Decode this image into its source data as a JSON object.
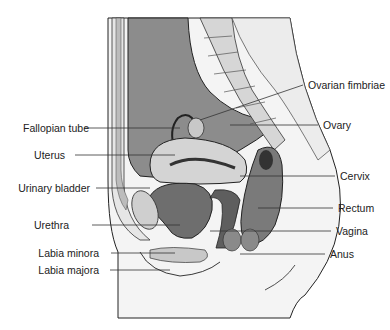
{
  "diagram": {
    "type": "anatomical-sagittal-section",
    "colors": {
      "background": "#ffffff",
      "cavity_gray": "#8c8c8c",
      "tissue_dark": "#6e6e6e",
      "tissue_mid": "#a8a8a8",
      "tissue_light": "#d8d8d8",
      "skin": "#efefef",
      "outline": "#222222"
    },
    "labels_left": [
      {
        "text": "Fallopian tube",
        "x": 93,
        "y": 128,
        "lx1": 84,
        "lx2": 180
      },
      {
        "text": "Uterus",
        "x": 69,
        "y": 155,
        "lx1": 75,
        "lx2": 175
      },
      {
        "text": "Urinary bladder",
        "x": 94,
        "y": 188,
        "lx1": 96,
        "lx2": 150
      },
      {
        "text": "Urethra",
        "x": 73,
        "y": 225,
        "lx1": 92,
        "lx2": 180
      },
      {
        "text": "Labia minora",
        "x": 103,
        "y": 253,
        "lx1": 111,
        "lx2": 175
      },
      {
        "text": "Labia majora",
        "x": 103,
        "y": 270,
        "lx1": 110,
        "lx2": 170
      }
    ],
    "labels_right": [
      {
        "text": "Ovarian fimbriae",
        "x": 308,
        "y": 85,
        "lx1": 200,
        "lx2": 303
      },
      {
        "text": "Ovary",
        "x": 323,
        "y": 125,
        "lx1": 230,
        "lx2": 318
      },
      {
        "text": "Cervix",
        "x": 340,
        "y": 176,
        "lx1": 240,
        "lx2": 335
      },
      {
        "text": "Rectum",
        "x": 338,
        "y": 208,
        "lx1": 258,
        "lx2": 333
      },
      {
        "text": "Vagina",
        "x": 336,
        "y": 231,
        "lx1": 210,
        "lx2": 331
      },
      {
        "text": "Anus",
        "x": 330,
        "y": 254,
        "lx1": 240,
        "lx2": 325
      }
    ]
  }
}
